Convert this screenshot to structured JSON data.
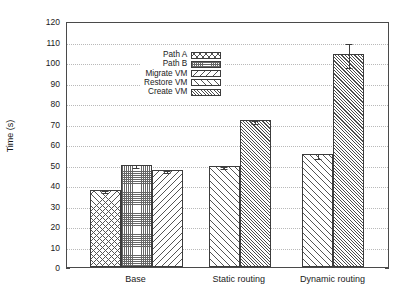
{
  "chart_data": {
    "type": "bar",
    "title": "",
    "xlabel": "",
    "ylabel": "Time (s)",
    "ylim": [
      0,
      120
    ],
    "ytick_step": 10,
    "yticks": [
      0,
      10,
      20,
      30,
      40,
      50,
      60,
      70,
      80,
      90,
      100,
      110,
      120
    ],
    "grid": true,
    "legend_position": "upper left",
    "categories": [
      "Base",
      "Static routing",
      "Dynamic routing"
    ],
    "series": [
      {
        "name": "Path A",
        "pattern": "crosshatch",
        "values": [
          37.5,
          null,
          null
        ],
        "errors": [
          0.6,
          null,
          null
        ]
      },
      {
        "name": "Path B",
        "pattern": "dots",
        "values": [
          50.0,
          null,
          null
        ],
        "errors": [
          0.5,
          null,
          null
        ]
      },
      {
        "name": "Migrate VM",
        "pattern": "diag-back",
        "values": [
          47.5,
          49.5,
          55.0
        ],
        "errors": [
          0.5,
          0.5,
          1.2
        ]
      },
      {
        "name": "Restore VM",
        "pattern": "diag-fwd",
        "values": [
          null,
          null,
          null
        ],
        "errors": [
          null,
          null,
          null
        ]
      },
      {
        "name": "Create VM",
        "pattern": "diag-dense",
        "values": [
          null,
          71.5,
          104.0
        ],
        "errors": [
          null,
          0.6,
          6.0
        ]
      }
    ],
    "bars": [
      {
        "group": "Base",
        "series": "Path A",
        "value": 37.5,
        "error": 0.6,
        "pattern": "crosshatch"
      },
      {
        "group": "Base",
        "series": "Path B",
        "value": 50.0,
        "error": 0.5,
        "pattern": "dots"
      },
      {
        "group": "Base",
        "series": "Migrate VM",
        "value": 47.5,
        "error": 0.5,
        "pattern": "diag-back"
      },
      {
        "group": "Static routing",
        "series": "Restore VM",
        "value": 49.5,
        "error": 0.5,
        "pattern": "diag-fwd"
      },
      {
        "group": "Static routing",
        "series": "Create VM",
        "value": 71.5,
        "error": 0.6,
        "pattern": "diag-dense"
      },
      {
        "group": "Dynamic routing",
        "series": "Restore VM",
        "value": 55.0,
        "error": 1.2,
        "pattern": "diag-fwd"
      },
      {
        "group": "Dynamic routing",
        "series": "Create VM",
        "value": 104.0,
        "error": 6.0,
        "pattern": "diag-dense"
      }
    ]
  },
  "legend": {
    "items": [
      {
        "label": "Path A",
        "pattern": "crosshatch"
      },
      {
        "label": "Path B",
        "pattern": "dots"
      },
      {
        "label": "Migrate VM",
        "pattern": "diag-back"
      },
      {
        "label": "Restore VM",
        "pattern": "diag-fwd"
      },
      {
        "label": "Create VM",
        "pattern": "diag-dense"
      }
    ]
  }
}
